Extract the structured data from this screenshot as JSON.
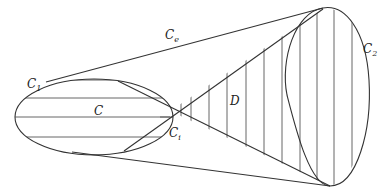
{
  "diagram": {
    "type": "geometric region diagram",
    "labels": {
      "c1": {
        "main": "C",
        "sub": "1"
      },
      "c2": {
        "main": "C",
        "sub": "2"
      },
      "ce": {
        "main": "C",
        "sub": "e"
      },
      "ci": {
        "main": "C",
        "sub": "i"
      },
      "c": {
        "main": "C"
      },
      "d": {
        "main": "D"
      }
    },
    "elements": [
      "ellipse C1 (left, horizontally hatched, contains region C)",
      "egg-shaped closed curve C2 (right)",
      "outer common tangents Ce",
      "inner crossing tangents meeting at Ci",
      "region D between inner tangents, vertically hatched"
    ],
    "colors": {
      "stroke": "#333333",
      "hatch": "#555555",
      "background": "#ffffff"
    }
  }
}
